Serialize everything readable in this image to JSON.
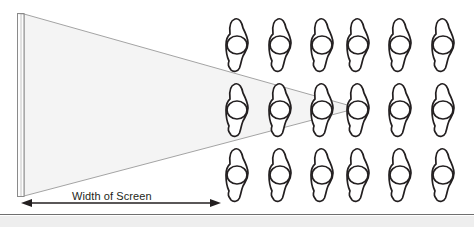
{
  "diagram": {
    "type": "theater-screen-viewing-angle",
    "title": "Width of Screen",
    "labels": {
      "width_of_screen": "Width of Screen"
    },
    "screen": {
      "name": "projection-screen",
      "x": 17,
      "top_y": 13,
      "bottom_y": 197,
      "thickness": 7,
      "face_color": "#fefefe",
      "edge_color": "#8a8a8a"
    },
    "view_cone": {
      "name": "viewing-cone",
      "fill": "#f4f4f4",
      "stroke": "#9a9a9a",
      "apex_x": 358,
      "apex_y": 108,
      "base_x": 24,
      "base_top_y": 14,
      "base_bottom_y": 196
    },
    "dimension_arrow": {
      "name": "width-of-screen-dimension",
      "y": 203,
      "x_start": 21,
      "x_end": 221,
      "color": "#231f20",
      "double_headed": true
    },
    "baseline_rule": {
      "name": "floor-rule",
      "y": 214,
      "color": "#6f6f6f"
    },
    "bottom_band": {
      "name": "bottom-band",
      "y": 216,
      "height": 11,
      "color": "#eeeeee"
    },
    "seating": {
      "name": "audience-grid",
      "rows": 3,
      "columns": 6,
      "row_centers_y": [
        45,
        110,
        175
      ],
      "column_centers_x": [
        237,
        280,
        322,
        358,
        400,
        443
      ],
      "figure": {
        "name": "seated-person-figure",
        "body_stroke": "#231f20",
        "head_stroke": "#231f20",
        "fill": "#ffffff",
        "body_height": 52,
        "body_width": 22,
        "head_rx": 10,
        "head_ry": 9
      },
      "seats": [
        {
          "row": 1,
          "col": 1,
          "label": "seat-r1c1"
        },
        {
          "row": 1,
          "col": 2,
          "label": "seat-r1c2"
        },
        {
          "row": 1,
          "col": 3,
          "label": "seat-r1c3"
        },
        {
          "row": 1,
          "col": 4,
          "label": "seat-r1c4"
        },
        {
          "row": 1,
          "col": 5,
          "label": "seat-r1c5"
        },
        {
          "row": 1,
          "col": 6,
          "label": "seat-r1c6"
        },
        {
          "row": 2,
          "col": 1,
          "label": "seat-r2c1"
        },
        {
          "row": 2,
          "col": 2,
          "label": "seat-r2c2"
        },
        {
          "row": 2,
          "col": 3,
          "label": "seat-r2c3"
        },
        {
          "row": 2,
          "col": 4,
          "label": "seat-r2c4"
        },
        {
          "row": 2,
          "col": 5,
          "label": "seat-r2c5"
        },
        {
          "row": 2,
          "col": 6,
          "label": "seat-r2c6"
        },
        {
          "row": 3,
          "col": 1,
          "label": "seat-r3c1"
        },
        {
          "row": 3,
          "col": 2,
          "label": "seat-r3c2"
        },
        {
          "row": 3,
          "col": 3,
          "label": "seat-r3c3"
        },
        {
          "row": 3,
          "col": 4,
          "label": "seat-r3c4"
        },
        {
          "row": 3,
          "col": 5,
          "label": "seat-r3c5"
        },
        {
          "row": 3,
          "col": 6,
          "label": "seat-r3c6"
        }
      ]
    }
  }
}
